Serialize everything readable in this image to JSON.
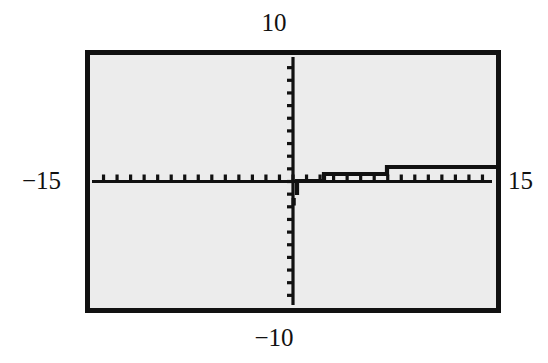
{
  "figure": {
    "kind": "graphing-calculator-screen",
    "background_color": "#ffffff",
    "screen_fill": "#ececec",
    "ink_color": "#111111"
  },
  "labels": {
    "y_max": "10",
    "y_min": "−10",
    "x_min": "−15",
    "x_max": "15"
  },
  "chart_data": {
    "type": "line",
    "title": "",
    "subtitle": "",
    "xlabel": "",
    "ylabel": "",
    "xlim": [
      -15,
      15
    ],
    "ylim": [
      -10,
      10
    ],
    "grid": false,
    "legend": null,
    "x_tick_step": 1,
    "y_tick_step": 1,
    "x_tick_values": [
      -15,
      -14,
      -13,
      -12,
      -11,
      -10,
      -9,
      -8,
      -7,
      -6,
      -5,
      -4,
      -3,
      -2,
      -1,
      0,
      1,
      2,
      3,
      4,
      5,
      6,
      7,
      8,
      9,
      10,
      11,
      12,
      13,
      14,
      15
    ],
    "y_tick_values": [
      -10,
      -9,
      -8,
      -7,
      -6,
      -5,
      -4,
      -3,
      -2,
      -1,
      0,
      1,
      2,
      3,
      4,
      5,
      6,
      7,
      8,
      9,
      10
    ],
    "x_tick_labels": [],
    "y_tick_labels": [],
    "annotations": [],
    "series": [
      {
        "name": "y = log(x)",
        "domain": "x > 0",
        "style": "stepped-pixel-curve",
        "color": "#111111",
        "x": [
          0.05,
          0.1,
          0.2,
          0.3,
          0.4,
          0.5,
          0.6,
          0.7,
          0.8,
          0.9,
          1.0,
          1.2,
          1.4,
          1.6,
          1.8,
          2.0,
          2.5,
          3.0,
          3.5,
          4.0,
          4.5,
          5.0,
          6.0,
          7.0,
          8.0,
          9.0,
          10.0,
          11.0,
          12.0,
          13.0,
          14.0,
          15.0
        ],
        "y": [
          -1.301,
          -1.0,
          -0.699,
          -0.523,
          -0.398,
          -0.301,
          -0.222,
          -0.155,
          -0.097,
          -0.046,
          0.0,
          0.079,
          0.146,
          0.204,
          0.255,
          0.301,
          0.398,
          0.477,
          0.544,
          0.602,
          0.653,
          0.699,
          0.778,
          0.845,
          0.903,
          0.954,
          1.0,
          1.041,
          1.079,
          1.114,
          1.146,
          1.176
        ]
      }
    ]
  }
}
